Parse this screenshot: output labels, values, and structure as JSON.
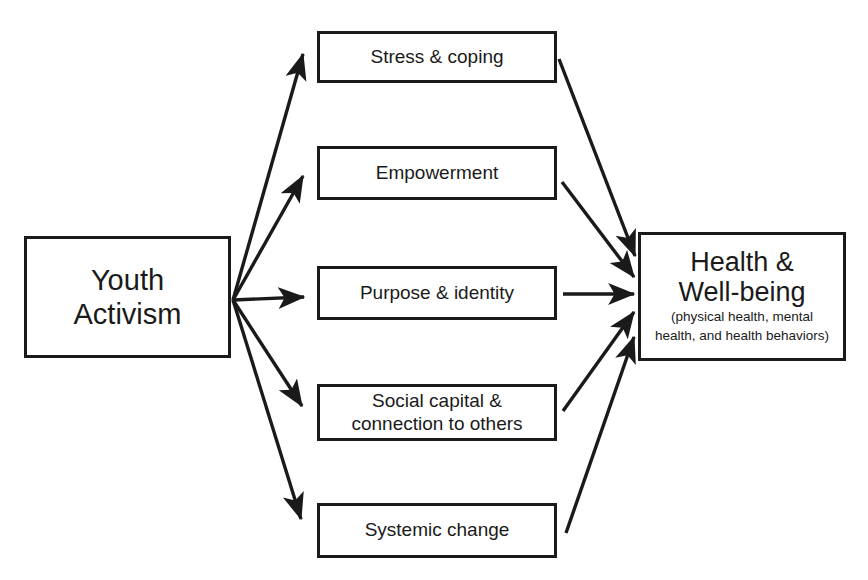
{
  "diagram": {
    "stroke_color": "#1a1a1a",
    "background_color": "#ffffff",
    "source": {
      "id": "youth-activism",
      "line1": "Youth",
      "line2": "Activism"
    },
    "outcome": {
      "id": "health-well-being",
      "headline1": "Health &",
      "headline2": "Well-being",
      "subtext1": "(physical health, mental",
      "subtext2": "health, and health behaviors)"
    },
    "mediators": [
      {
        "id": "stress-coping",
        "line1": "Stress & coping",
        "line2": ""
      },
      {
        "id": "empowerment",
        "line1": "Empowerment",
        "line2": ""
      },
      {
        "id": "purpose-identity",
        "line1": "Purpose & identity",
        "line2": ""
      },
      {
        "id": "social-capital",
        "line1": "Social capital &",
        "line2": "connection to others"
      },
      {
        "id": "systemic-change",
        "line1": "Systemic change",
        "line2": ""
      }
    ],
    "arrows": {
      "from_source_count": 5,
      "to_outcome_count": 5,
      "direction": "left-to-right"
    }
  }
}
